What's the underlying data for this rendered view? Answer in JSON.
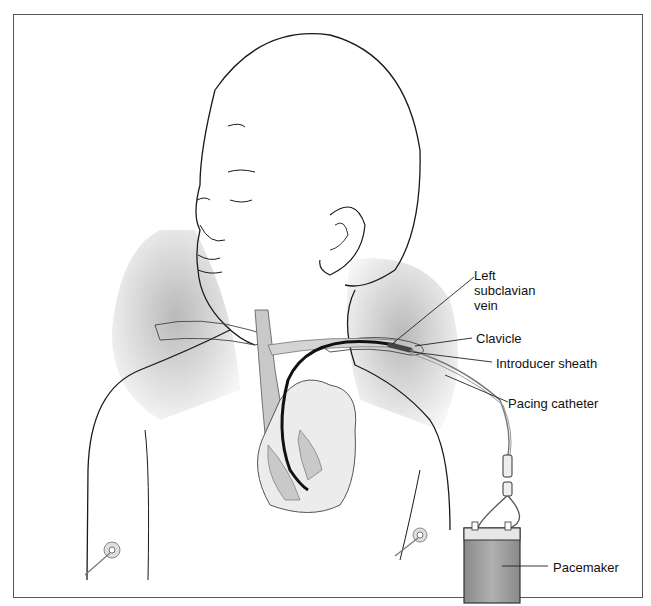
{
  "figure": {
    "labels": {
      "left_subclavian_vein": "Left\nsubclavian\nvein",
      "clavicle": "Clavicle",
      "introducer_sheath": "Introducer sheath",
      "pacing_catheter": "Pacing catheter",
      "pacemaker": "Pacemaker"
    },
    "colors": {
      "line": "#1a1a1a",
      "shadow": "#b8b8b8",
      "vessel_fill": "#c9c9c9",
      "catheter": "#111111",
      "pacemaker_body": "#9a9a9a",
      "pacemaker_top": "#e6e6e6"
    }
  }
}
